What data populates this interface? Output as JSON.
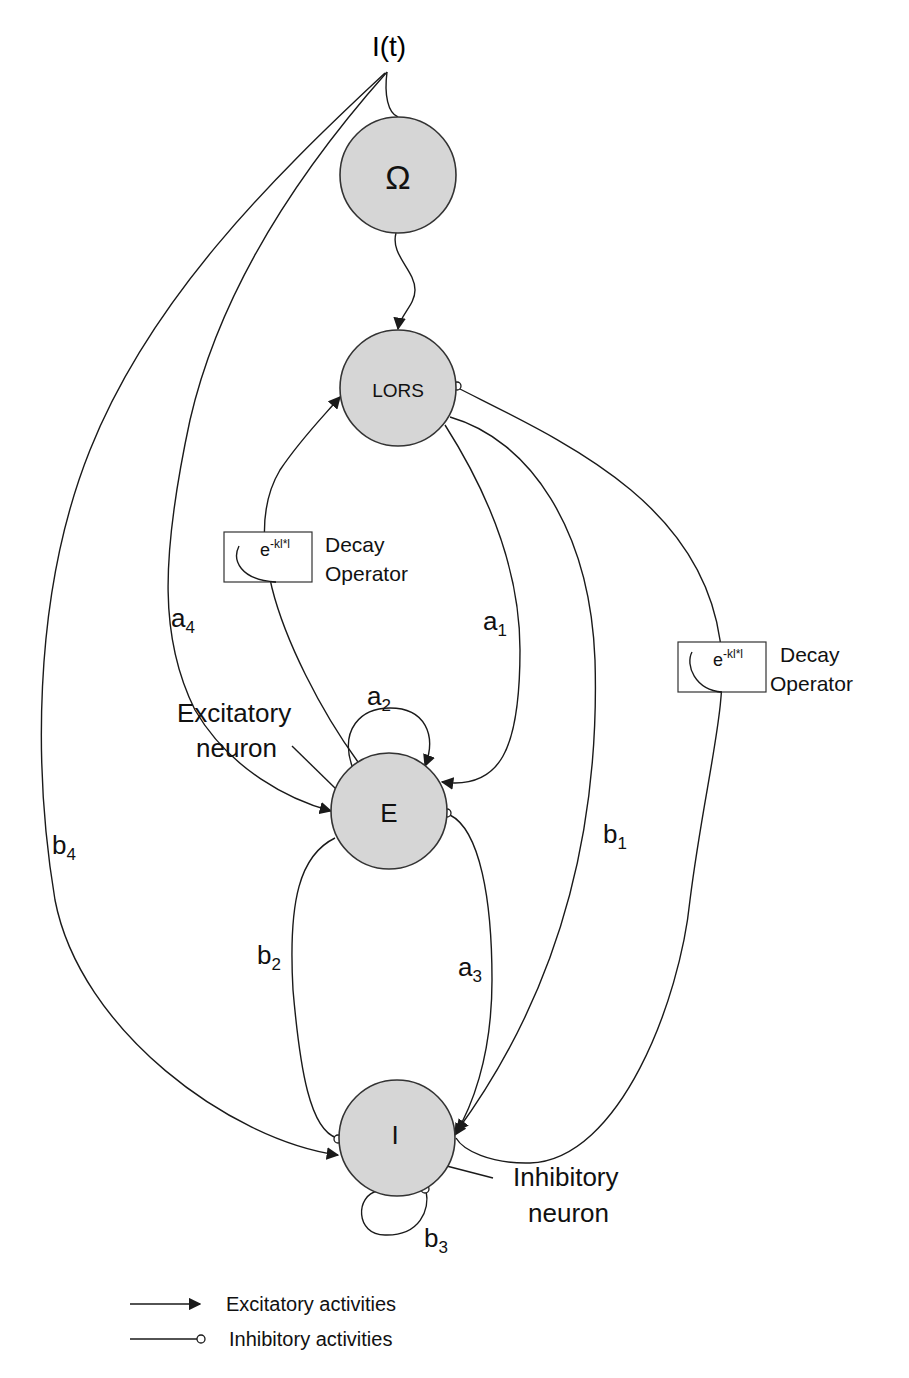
{
  "input": {
    "label": "I(t)"
  },
  "nodes": {
    "omega": {
      "label": "Ω"
    },
    "lors": {
      "label": "LORS"
    },
    "excitatory": {
      "label": "E"
    },
    "inhibitory": {
      "label": "I"
    }
  },
  "edge_labels": {
    "a1": {
      "base": "a",
      "sub": "1"
    },
    "a2": {
      "base": "a",
      "sub": "2"
    },
    "a3": {
      "base": "a",
      "sub": "3"
    },
    "a4": {
      "base": "a",
      "sub": "4"
    },
    "b1": {
      "base": "b",
      "sub": "1"
    },
    "b2": {
      "base": "b",
      "sub": "2"
    },
    "b3": {
      "base": "b",
      "sub": "3"
    },
    "b4": {
      "base": "b",
      "sub": "4"
    }
  },
  "decay_operators": [
    {
      "expr_base": "e",
      "expr_sup": "-kl*l",
      "label_line1": "Decay",
      "label_line2": "Operator"
    },
    {
      "expr_base": "e",
      "expr_sup": "-kl*l",
      "label_line1": "Decay",
      "label_line2": "Operator"
    }
  ],
  "annotations": {
    "excitatory_neuron": {
      "line1": "Excitatory",
      "line2": "neuron"
    },
    "inhibitory_neuron": {
      "line1": "Inhibitory",
      "line2": "neuron"
    }
  },
  "legend": {
    "excitatory": "Excitatory activities",
    "inhibitory": "Inhibitory activities"
  },
  "colors": {
    "node_fill": "#d6d6d6",
    "stroke": "#1a1a1a",
    "background": "#ffffff"
  }
}
